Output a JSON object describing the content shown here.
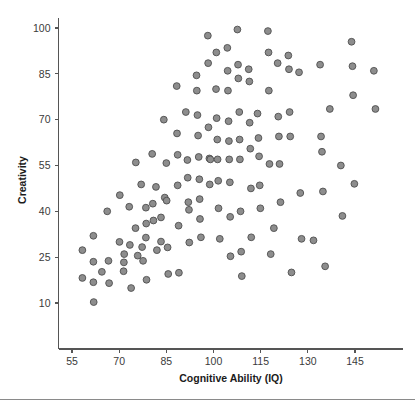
{
  "chart_data": {
    "type": "scatter",
    "title": "",
    "xlabel": "Cognitive Ability (IQ)",
    "ylabel": "Creativity",
    "xlim": [
      50,
      157
    ],
    "ylim": [
      2,
      104
    ],
    "xticks": [
      55,
      70,
      85,
      100,
      115,
      130,
      145
    ],
    "yticks": [
      10,
      25,
      40,
      55,
      70,
      85,
      100
    ],
    "grid": false,
    "legend": null,
    "marker": {
      "shape": "circle",
      "fill_color": "#8d8d8d",
      "edge_color": "#4f4f4f",
      "size_px": 4.6
    },
    "n_points": 139,
    "points": [
      [
        58.3,
        27.3
      ],
      [
        58.3,
        18.2
      ],
      [
        61.8,
        32.0
      ],
      [
        61.8,
        23.5
      ],
      [
        61.8,
        16.8
      ],
      [
        61.9,
        10.3
      ],
      [
        64.5,
        20.2
      ],
      [
        66.2,
        40.0
      ],
      [
        66.6,
        23.8
      ],
      [
        66.8,
        16.5
      ],
      [
        70.2,
        45.3
      ],
      [
        70.1,
        30.0
      ],
      [
        71.6,
        26.0
      ],
      [
        71.4,
        20.4
      ],
      [
        71.5,
        23.3
      ],
      [
        73.2,
        41.5
      ],
      [
        73.4,
        29.0
      ],
      [
        73.8,
        14.9
      ],
      [
        75.3,
        56.0
      ],
      [
        75.2,
        34.5
      ],
      [
        75.9,
        25.5
      ],
      [
        77.0,
        48.8
      ],
      [
        77.3,
        28.3
      ],
      [
        77.6,
        23.8
      ],
      [
        78.5,
        41.2
      ],
      [
        78.6,
        36.0
      ],
      [
        78.5,
        31.4
      ],
      [
        78.7,
        17.6
      ],
      [
        80.5,
        58.8
      ],
      [
        80.7,
        42.5
      ],
      [
        80.9,
        37.0
      ],
      [
        81.7,
        48.0
      ],
      [
        82.0,
        27.3
      ],
      [
        83.3,
        38.0
      ],
      [
        83.3,
        30.1
      ],
      [
        84.2,
        70.0
      ],
      [
        84.5,
        44.5
      ],
      [
        85.0,
        55.8
      ],
      [
        85.1,
        43.5
      ],
      [
        85.4,
        28.2
      ],
      [
        85.6,
        19.5
      ],
      [
        88.3,
        81.0
      ],
      [
        88.4,
        65.5
      ],
      [
        88.6,
        58.5
      ],
      [
        88.6,
        48.5
      ],
      [
        88.9,
        35.3
      ],
      [
        89.0,
        19.9
      ],
      [
        91.2,
        72.5
      ],
      [
        91.7,
        56.8
      ],
      [
        91.8,
        51.0
      ],
      [
        92.0,
        43.0
      ],
      [
        92.2,
        40.5
      ],
      [
        92.3,
        29.8
      ],
      [
        94.6,
        84.5
      ],
      [
        94.7,
        79.5
      ],
      [
        94.9,
        71.5
      ],
      [
        95.1,
        64.8
      ],
      [
        95.3,
        57.8
      ],
      [
        95.5,
        50.5
      ],
      [
        95.6,
        44.0
      ],
      [
        95.7,
        37.5
      ],
      [
        96.0,
        31.5
      ],
      [
        98.2,
        97.5
      ],
      [
        98.3,
        88.5
      ],
      [
        98.4,
        67.5
      ],
      [
        98.7,
        57.3
      ],
      [
        98.8,
        48.8
      ],
      [
        99.0,
        57.0
      ],
      [
        100.9,
        92.0
      ],
      [
        100.8,
        80.0
      ],
      [
        101.0,
        70.5
      ],
      [
        101.2,
        63.5
      ],
      [
        101.3,
        57.0
      ],
      [
        101.5,
        50.0
      ],
      [
        101.6,
        41.0
      ],
      [
        102.0,
        31.0
      ],
      [
        104.4,
        93.5
      ],
      [
        104.5,
        86.0
      ],
      [
        104.6,
        79.5
      ],
      [
        104.8,
        69.5
      ],
      [
        104.9,
        63.0
      ],
      [
        105.0,
        57.0
      ],
      [
        105.2,
        49.5
      ],
      [
        105.3,
        38.2
      ],
      [
        105.4,
        25.3
      ],
      [
        107.6,
        99.5
      ],
      [
        107.8,
        88.0
      ],
      [
        107.9,
        83.5
      ],
      [
        108.2,
        72.5
      ],
      [
        108.3,
        63.5
      ],
      [
        108.4,
        57.0
      ],
      [
        108.6,
        40.0
      ],
      [
        108.8,
        26.8
      ],
      [
        109.0,
        18.8
      ],
      [
        111.2,
        86.5
      ],
      [
        111.4,
        82.5
      ],
      [
        111.5,
        69.0
      ],
      [
        111.7,
        60.5
      ],
      [
        111.9,
        47.5
      ],
      [
        112.0,
        31.5
      ],
      [
        114.0,
        72.0
      ],
      [
        114.3,
        64.0
      ],
      [
        114.5,
        58.0
      ],
      [
        114.7,
        48.5
      ],
      [
        114.9,
        41.0
      ],
      [
        117.3,
        99.0
      ],
      [
        117.5,
        92.0
      ],
      [
        117.6,
        79.5
      ],
      [
        117.8,
        55.5
      ],
      [
        118.2,
        26.0
      ],
      [
        120.4,
        88.5
      ],
      [
        120.6,
        71.0
      ],
      [
        120.8,
        64.5
      ],
      [
        121.0,
        55.5
      ],
      [
        121.3,
        43.0
      ],
      [
        123.8,
        91.0
      ],
      [
        124.0,
        86.5
      ],
      [
        124.2,
        72.5
      ],
      [
        124.4,
        64.5
      ],
      [
        124.8,
        20.0
      ],
      [
        127.2,
        85.5
      ],
      [
        127.6,
        46.0
      ],
      [
        128.0,
        31.0
      ],
      [
        133.9,
        88.0
      ],
      [
        134.2,
        64.5
      ],
      [
        134.5,
        59.5
      ],
      [
        134.8,
        46.5
      ],
      [
        137.0,
        73.5
      ],
      [
        140.5,
        55.0
      ],
      [
        141.0,
        38.5
      ],
      [
        143.9,
        95.5
      ],
      [
        144.2,
        87.5
      ],
      [
        144.4,
        78.0
      ],
      [
        151.0,
        86.0
      ],
      [
        151.5,
        73.5
      ],
      [
        144.8,
        49.0
      ],
      [
        131.8,
        30.5
      ],
      [
        135.5,
        22.0
      ],
      [
        119.2,
        34.5
      ]
    ]
  },
  "axis": {
    "x_title": "Cognitive Ability (IQ)",
    "y_title": "Creativity",
    "x_tick_labels": [
      "55",
      "70",
      "85",
      "100",
      "115",
      "130",
      "145"
    ],
    "y_tick_labels": [
      "100",
      "85",
      "70",
      "55",
      "40",
      "25",
      "10"
    ]
  },
  "colors": {
    "marker_fill": "#8d8d8d",
    "marker_edge": "#4f4f4f",
    "axis": "#555555",
    "text": "#1b1b1b",
    "background": "#ffffff"
  }
}
